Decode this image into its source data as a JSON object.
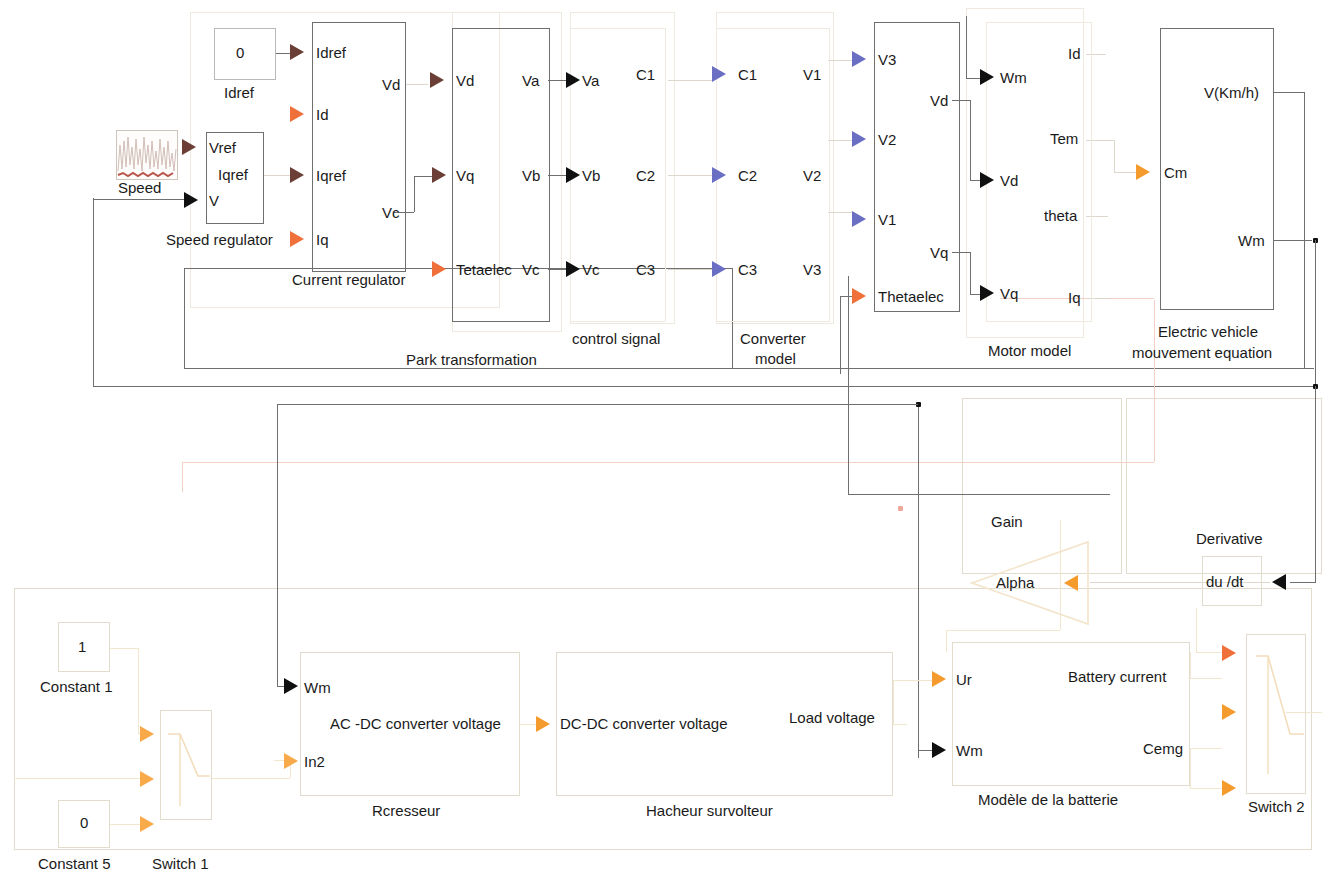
{
  "diagram": {
    "colors": {
      "port_dark": "#6b3f35",
      "port_black": "#101010",
      "port_blue": "#6b6fc4",
      "port_red": "#f0703c",
      "port_orange": "#f59b2e",
      "wire": "#6f6f6f",
      "wire_faint": "#ded8cc",
      "wire_pink": "#f3cfc6",
      "background": "#ffffff"
    }
  },
  "blocks": {
    "idref_const": {
      "name": "Idref",
      "value": "0"
    },
    "speed_source": {
      "name": "Speed"
    },
    "speed_regulator": {
      "name": "Speed regulator",
      "inputs": [
        "Vref",
        "V"
      ],
      "outputs": [
        "Iqref"
      ]
    },
    "current_regulator": {
      "name": "Current regulator",
      "inputs": [
        "Idref",
        "Id",
        "Iqref",
        "Iq"
      ],
      "outputs": [
        "Vd",
        "Vc"
      ]
    },
    "park_transformation": {
      "name": "Park transformation",
      "inputs": [
        "Vd",
        "Vq",
        "Tetaelec"
      ],
      "outputs": [
        "Va",
        "Vb",
        "Vc"
      ]
    },
    "control_signal": {
      "name": "control signal",
      "inputs": [
        "Va",
        "Vb",
        "Vc"
      ],
      "outputs": [
        "C1",
        "C2",
        "C3"
      ]
    },
    "converter_model": {
      "name": "Converter model",
      "name_line1": "Converter",
      "name_line2": "model",
      "inputs": [
        "C1",
        "C2",
        "C3"
      ],
      "outputs": [
        "V1",
        "V2",
        "V3"
      ]
    },
    "inverter_stage": {
      "name": "",
      "inputs": [
        "V3",
        "V2",
        "V1",
        "Thetaelec"
      ],
      "outputs": [
        "Vd",
        "Vq"
      ]
    },
    "motor_model": {
      "name": "Motor model",
      "inputs": [
        "Wm",
        "Vd",
        "Vq"
      ],
      "outputs": [
        "Id",
        "Tem",
        "theta",
        "Iq"
      ]
    },
    "electric_vehicle": {
      "name": "Electric vehicle mouvement equation",
      "name_line1": "Electric vehicle",
      "name_line2": "mouvement equation",
      "inputs": [
        "Cm"
      ],
      "outputs": [
        "V(Km/h)",
        "Wm"
      ]
    },
    "gain": {
      "name": "Gain",
      "label": "Alpha"
    },
    "derivative": {
      "name": "Derivative",
      "label": "du /dt"
    },
    "constant1": {
      "name": "Constant 1",
      "value": "1"
    },
    "constant5": {
      "name": "Constant 5",
      "value": "0"
    },
    "switch1": {
      "name": "Switch 1"
    },
    "switch2": {
      "name": "Switch 2"
    },
    "redresseur": {
      "name": "Rcresseur",
      "inputs": [
        "Wm",
        "In2"
      ],
      "outputs": [
        "AC -DC converter voltage"
      ]
    },
    "hacheur": {
      "name": "Hacheur survolteur",
      "inputs": [
        "DC-DC converter voltage"
      ],
      "outputs": [
        "Load voltage"
      ]
    },
    "battery": {
      "name": "Modèle de la batterie",
      "inputs": [
        "Ur",
        "Wm"
      ],
      "outputs": [
        "Battery current",
        "Cemg"
      ]
    }
  }
}
